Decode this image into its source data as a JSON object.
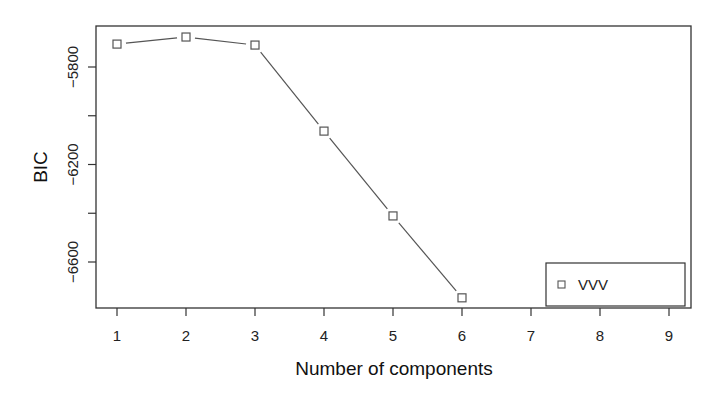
{
  "chart_data": {
    "type": "line",
    "title": "",
    "xlabel": "Number of components",
    "ylabel": "BIC",
    "x_ticks": [
      "1",
      "2",
      "3",
      "4",
      "5",
      "6",
      "7",
      "8",
      "9"
    ],
    "y_ticks": [
      "-5800",
      "-6200",
      "-6600"
    ],
    "y_minor_ticks": [
      -6000,
      -6400
    ],
    "xlim": [
      0.85,
      9.3
    ],
    "ylim": [
      -6810,
      -5645
    ],
    "grid": false,
    "legend_position": "bottom-right",
    "series": [
      {
        "name": "VVV",
        "marker": "open-square",
        "color": "#555555",
        "x": [
          1,
          2,
          3,
          4,
          5,
          6
        ],
        "values": [
          -5706,
          -5677,
          -5710,
          -6063,
          -6411,
          -6747
        ]
      }
    ]
  },
  "legend": {
    "items": [
      {
        "label": "VVV"
      }
    ]
  }
}
